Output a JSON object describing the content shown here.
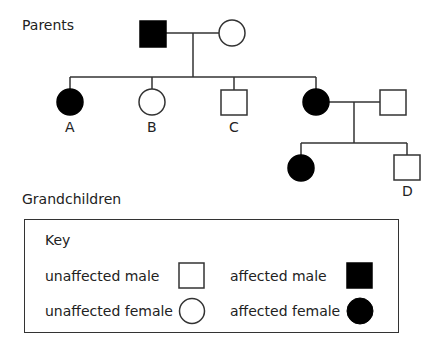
{
  "generations": {
    "parents_label": "Parents",
    "grandchildren_label": "Grandchildren"
  },
  "individuals": [
    {
      "id": "father",
      "sex": "male",
      "affected": true,
      "generation": "parents",
      "label": ""
    },
    {
      "id": "mother",
      "sex": "female",
      "affected": false,
      "generation": "parents",
      "label": ""
    },
    {
      "id": "A",
      "sex": "female",
      "affected": true,
      "generation": "children",
      "label": "A"
    },
    {
      "id": "B",
      "sex": "female",
      "affected": false,
      "generation": "children",
      "label": "B"
    },
    {
      "id": "C",
      "sex": "male",
      "affected": false,
      "generation": "children",
      "label": "C"
    },
    {
      "id": "daughter",
      "sex": "female",
      "affected": true,
      "generation": "children",
      "label": ""
    },
    {
      "id": "son_in_law",
      "sex": "male",
      "affected": false,
      "generation": "children",
      "label": ""
    },
    {
      "id": "granddaughter",
      "sex": "female",
      "affected": true,
      "generation": "grandchildren",
      "label": ""
    },
    {
      "id": "D",
      "sex": "male",
      "affected": false,
      "generation": "grandchildren",
      "label": "D"
    }
  ],
  "labels": {
    "A": "A",
    "B": "B",
    "C": "C",
    "D": "D"
  },
  "key": {
    "title": "Key",
    "unaffected_male": "unaffected male",
    "affected_male": "affected male",
    "unaffected_female": "unaffected female",
    "affected_female": "affected female"
  },
  "colors": {
    "affected_fill": "#000000",
    "unaffected_fill": "#ffffff",
    "line": "#333333"
  }
}
